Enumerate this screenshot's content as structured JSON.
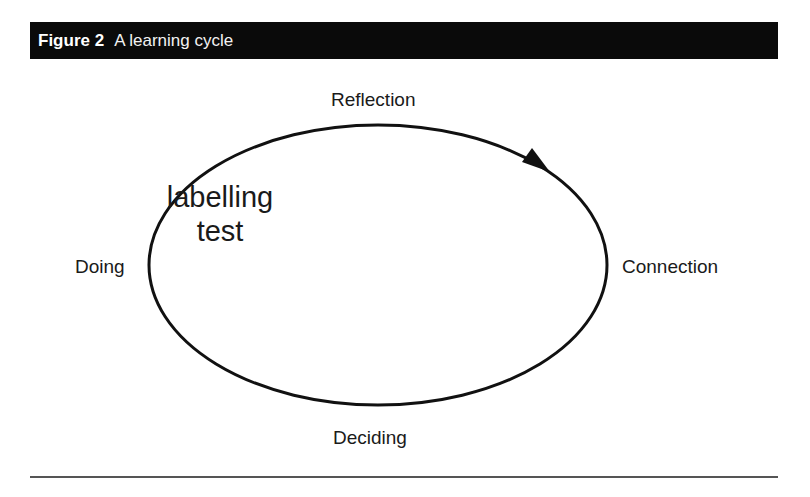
{
  "figure": {
    "number": "Figure 2",
    "title": "A learning cycle"
  },
  "cycle": {
    "stages": {
      "top": "Reflection",
      "right": "Connection",
      "bottom": "Deciding",
      "left": "Doing"
    },
    "direction": "clockwise",
    "annotation": [
      "labelling",
      "test"
    ]
  },
  "colors": {
    "header_bg": "#0a0a0a",
    "header_text": "#ffffff",
    "line": "#111111"
  }
}
